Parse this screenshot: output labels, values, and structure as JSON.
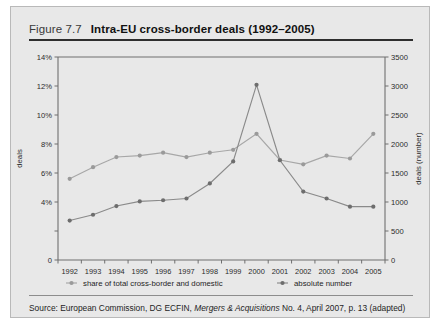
{
  "figure": {
    "number": "Figure 7.7",
    "title": "Intra-EU cross-border deals (1992–2005)"
  },
  "source": {
    "prefix": "Source: European Commission, DG ECFIN, ",
    "italic": "Mergers & Acquisitions",
    "suffix": " No. 4, April 2007, p. 13 (adapted)"
  },
  "axes": {
    "left_title": "deals",
    "right_title": "deals (number)",
    "left_ticks": [
      "0",
      "",
      "4%",
      "6%",
      "8%",
      "10%",
      "12%",
      "14%"
    ],
    "left_tick_values": [
      0,
      2,
      4,
      6,
      8,
      10,
      12,
      14
    ],
    "left_tick_labels": [
      "0",
      "",
      "4%",
      "6%",
      "8%",
      "10%",
      "12%",
      "14%"
    ],
    "right_tick_values": [
      0,
      500,
      1000,
      1500,
      2000,
      2500,
      3000,
      3500
    ],
    "right_tick_labels": [
      "0",
      "500",
      "1000",
      "1500",
      "2000",
      "2500",
      "3000",
      "3500"
    ]
  },
  "legend": {
    "items": [
      {
        "label": "share of total cross-border and domestic",
        "color": "#a7a7a7"
      },
      {
        "label": "absolute number",
        "color": "#8a8a8a"
      }
    ]
  },
  "chart_data": {
    "type": "line",
    "title": "Intra-EU cross-border deals (1992–2005)",
    "xlabel": "",
    "ylabel": "deals",
    "y2label": "deals (number)",
    "grid": false,
    "legend_position": "bottom",
    "categories": [
      "1992",
      "1993",
      "1994",
      "1995",
      "1996",
      "1997",
      "1998",
      "1999",
      "2000",
      "2001",
      "2002",
      "2003",
      "2004",
      "2005"
    ],
    "ylim": [
      0,
      14
    ],
    "y2lim": [
      0,
      3500
    ],
    "series": [
      {
        "name": "share of total cross-border and domestic",
        "axis": "left",
        "unit": "%",
        "color": "#a7a7a7",
        "values": [
          5.6,
          6.4,
          7.1,
          7.2,
          7.4,
          7.1,
          7.4,
          7.6,
          8.7,
          6.9,
          6.6,
          7.2,
          7.0,
          8.7
        ]
      },
      {
        "name": "absolute number",
        "axis": "right",
        "unit": "number",
        "color": "#8a8a8a",
        "values": [
          680,
          780,
          930,
          1010,
          1030,
          1060,
          1320,
          1700,
          3020,
          1720,
          1180,
          1060,
          920,
          920
        ]
      }
    ]
  }
}
